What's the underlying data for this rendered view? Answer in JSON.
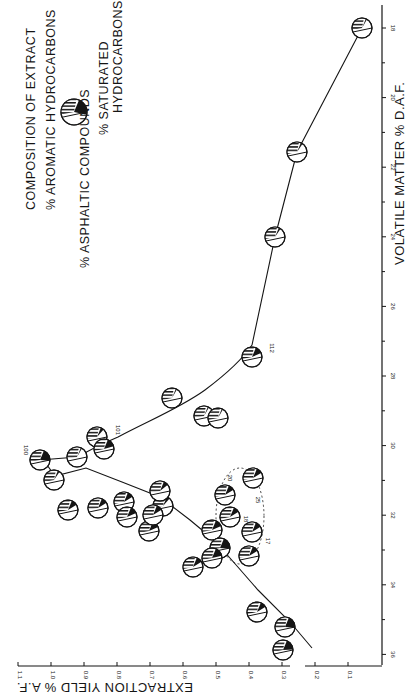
{
  "chart_data": {
    "type": "scatter",
    "orientation_note": "figure printed rotated 90 degrees clockwise",
    "title": "",
    "xlabel": "VOLATILE MATTER % D.A.F.",
    "ylabel": "EXTRACTION YIELD % A.F.",
    "xlim": [
      36,
      18
    ],
    "ylim": [
      0,
      1.1
    ],
    "x_ticks": [
      "18",
      "20",
      "22",
      "24",
      "26",
      "28",
      "30",
      "32",
      "34",
      "36"
    ],
    "y_ticks": [
      "0.1",
      "0.2",
      "0.3",
      "0.4",
      "0.5",
      "0.6",
      "0.7",
      "0.8",
      "0.9",
      "1.0",
      "1.1"
    ],
    "grid": false,
    "legend": {
      "title": "COMPOSITION OF EXTRACT",
      "entries": [
        "% AROMATIC HYDROCARBONS",
        "% ASPHALTIC COMPOUNDS",
        "% SATURATED HYDROCARBONS"
      ]
    },
    "series": [
      {
        "name": "Coal extracts",
        "points": [
          {
            "vm": 35.5,
            "yield": 0.27,
            "label": ""
          },
          {
            "vm": 35.1,
            "yield": 0.28,
            "label": ""
          },
          {
            "vm": 34.1,
            "yield": 0.37,
            "label": ""
          },
          {
            "vm": 33.4,
            "yield": 0.56,
            "label": ""
          },
          {
            "vm": 32.9,
            "yield": 0.49,
            "label": ""
          },
          {
            "vm": 32.7,
            "yield": 0.48,
            "label": ""
          },
          {
            "vm": 32.6,
            "yield": 0.4,
            "label": ""
          },
          {
            "vm": 32.3,
            "yield": 0.51,
            "label": ""
          },
          {
            "vm": 32.1,
            "yield": 0.47,
            "label": ""
          },
          {
            "vm": 32.1,
            "yield": 0.39,
            "label": "17"
          },
          {
            "vm": 31.9,
            "yield": 0.7,
            "label": ""
          },
          {
            "vm": 31.8,
            "yield": 0.81,
            "label": ""
          },
          {
            "vm": 31.7,
            "yield": 0.47,
            "label": "18"
          },
          {
            "vm": 31.5,
            "yield": 0.89,
            "label": ""
          },
          {
            "vm": 31.4,
            "yield": 0.81,
            "label": ""
          },
          {
            "vm": 31.4,
            "yield": 0.48,
            "label": "20"
          },
          {
            "vm": 31.3,
            "yield": 0.67,
            "label": ""
          },
          {
            "vm": 30.9,
            "yield": 0.39,
            "label": "25"
          },
          {
            "vm": 30.9,
            "yield": 1.02,
            "label": ""
          },
          {
            "vm": 30.3,
            "yield": 1.06,
            "label": "100"
          },
          {
            "vm": 30.3,
            "yield": 0.94,
            "label": ""
          },
          {
            "vm": 30.0,
            "yield": 0.84,
            "label": "101"
          },
          {
            "vm": 29.6,
            "yield": 0.86,
            "label": ""
          },
          {
            "vm": 29.1,
            "yield": 0.49,
            "label": ""
          },
          {
            "vm": 29.0,
            "yield": 0.54,
            "label": ""
          },
          {
            "vm": 28.6,
            "yield": 0.63,
            "label": ""
          },
          {
            "vm": 27.4,
            "yield": 0.39,
            "label": "112"
          },
          {
            "vm": 23.9,
            "yield": 0.31,
            "label": ""
          },
          {
            "vm": 21.6,
            "yield": 0.25,
            "label": ""
          },
          {
            "vm": 18.0,
            "yield": 0.06,
            "label": ""
          }
        ]
      }
    ],
    "curves": [
      {
        "name": "main-curve",
        "description": "rises from VM 36 (0.22) to peak ~1.06 at VM 30.3, then falls to ~0.06 at VM 18"
      },
      {
        "name": "lower-branch",
        "description": "secondary branch from ~VM 34 through ~0.5 at VM 32.5 to 1.02 near VM 30.9"
      }
    ],
    "annotations": [
      "100",
      "101",
      "112",
      "17",
      "18",
      "20",
      "25"
    ],
    "dashed_group": "points 17, 18, 20, 25 enclosed by dashed outline"
  },
  "labels": {
    "x_axis_title": "VOLATILE MATTER % D.A.F.",
    "y_axis_title": "EXTRACTION YIELD % A.F.",
    "legend_title": "COMPOSITION OF EXTRACT",
    "legend_aromatic": "% AROMATIC HYDROCARBONS",
    "legend_asphaltic": "% ASPHALTIC COMPOUNDS",
    "legend_saturated_1": "% SATURATED",
    "legend_saturated_2": "HYDROCARBONS"
  },
  "colors": {
    "ink": "#151515",
    "background": "#ffffff"
  }
}
